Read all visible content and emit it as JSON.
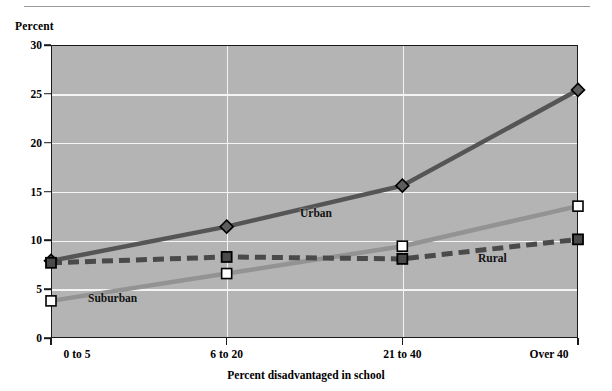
{
  "figure": {
    "y_axis_title": "Percent",
    "x_axis_title": "Percent disadvantaged in school"
  },
  "labels": {
    "urban": "Urban",
    "suburban": "Suburban",
    "rural": "Rural"
  },
  "colors": {
    "plot_background": "#b4b4b4",
    "gridline": "#f4f4f4",
    "axis": "#1a1a1a",
    "urban": "#555555",
    "suburban": "#939393",
    "rural": "#4a4a4a"
  },
  "chart_data": {
    "type": "line",
    "title": "",
    "xlabel": "Percent disadvantaged in school",
    "ylabel": "Percent",
    "categories": [
      "0 to 5",
      "6 to 20",
      "21 to 40",
      "Over 40"
    ],
    "yticks": [
      0,
      5,
      10,
      15,
      20,
      25,
      30
    ],
    "ylim": [
      0,
      30
    ],
    "grid": "both",
    "legend": "inline-annotations",
    "series": [
      {
        "name": "Urban",
        "values": [
          7.9,
          11.4,
          15.6,
          25.4
        ],
        "marker": "diamond",
        "linestyle": "solid",
        "color": "#555555"
      },
      {
        "name": "Suburban",
        "values": [
          3.8,
          6.6,
          9.4,
          13.5
        ],
        "marker": "square-open",
        "linestyle": "solid",
        "color": "#939393"
      },
      {
        "name": "Rural",
        "values": [
          7.7,
          8.3,
          8.1,
          10.1
        ],
        "marker": "square-filled",
        "linestyle": "dashed",
        "color": "#4a4a4a"
      }
    ]
  }
}
